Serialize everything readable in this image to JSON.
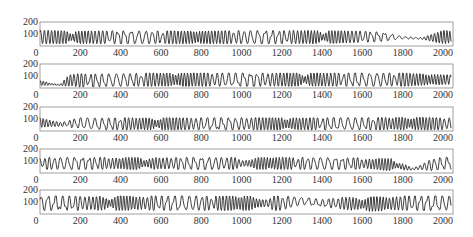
{
  "chart_data": [
    {
      "type": "line",
      "title": "",
      "xlabel": "",
      "ylabel": "",
      "xlim": [
        0,
        2050
      ],
      "ylim": [
        0,
        200
      ],
      "xticks": [
        0,
        200,
        400,
        600,
        800,
        1000,
        1200,
        1400,
        1600,
        1800,
        2000
      ],
      "yticks": [
        100,
        200
      ],
      "ytick_labels": [
        "200",
        "100"
      ],
      "x_origin_label": "0",
      "description": "Dense oscillation around 40-130; regular fast oscillation through ~1650, then slower waves, flat trough ~60 near 1800-1900, rising to ~130 near 2000",
      "envelope": {
        "x": [
          0,
          200,
          400,
          600,
          800,
          1000,
          1200,
          1400,
          1600,
          1700,
          1800,
          1900,
          2000
        ],
        "upper": [
          130,
          125,
          128,
          125,
          125,
          128,
          128,
          128,
          125,
          115,
          80,
          70,
          130
        ],
        "lower": [
          20,
          20,
          20,
          20,
          20,
          20,
          20,
          20,
          30,
          40,
          60,
          55,
          20
        ]
      }
    },
    {
      "type": "line",
      "title": "",
      "xlim": [
        0,
        2050
      ],
      "ylim": [
        0,
        200
      ],
      "xticks": [
        0,
        200,
        400,
        600,
        800,
        1000,
        1200,
        1400,
        1600,
        1800,
        2000
      ],
      "yticks": [
        100,
        200
      ],
      "description": "Low flat ~20-50 until ~120, large slow triangles ~150-350, then dense oscillation 20-125 through 2000 with a wide wave near 2000",
      "envelope": {
        "x": [
          0,
          100,
          150,
          300,
          400,
          600,
          800,
          1000,
          1200,
          1400,
          1600,
          1800,
          2000
        ],
        "upper": [
          60,
          30,
          120,
          115,
          120,
          125,
          125,
          125,
          125,
          125,
          125,
          125,
          110
        ],
        "lower": [
          20,
          20,
          10,
          10,
          15,
          15,
          15,
          15,
          15,
          15,
          15,
          15,
          30
        ]
      }
    },
    {
      "type": "line",
      "title": "",
      "xlim": [
        0,
        2050
      ],
      "ylim": [
        0,
        200
      ],
      "xticks": [
        0,
        200,
        400,
        600,
        800,
        1000,
        1200,
        1400,
        1600,
        1800,
        2000
      ],
      "yticks": [
        100,
        200
      ],
      "description": "Thick band 40-100 for 0-200, slow triangles 200-400, dense triangles to ~1800, larger triangles 1800-2000",
      "envelope": {
        "x": [
          0,
          100,
          200,
          300,
          400,
          600,
          800,
          1000,
          1200,
          1400,
          1600,
          1800,
          2000
        ],
        "upper": [
          110,
          70,
          110,
          105,
          110,
          110,
          110,
          110,
          110,
          110,
          110,
          115,
          110
        ],
        "lower": [
          30,
          40,
          20,
          10,
          10,
          10,
          10,
          10,
          10,
          10,
          10,
          10,
          10
        ]
      }
    },
    {
      "type": "line",
      "title": "",
      "xlim": [
        0,
        2050
      ],
      "ylim": [
        0,
        200
      ],
      "xticks": [
        0,
        200,
        400,
        600,
        800,
        1000,
        1200,
        1400,
        1600,
        1800,
        2000
      ],
      "yticks": [
        100,
        200
      ],
      "description": "Dense noisy oscillation 30-130 through ~1650, then wide peaks ~1750 and ~1950 with flat trough ~30 near 1800-1900",
      "envelope": {
        "x": [
          0,
          200,
          400,
          600,
          800,
          1000,
          1200,
          1400,
          1600,
          1750,
          1850,
          1950,
          2000
        ],
        "upper": [
          130,
          130,
          130,
          130,
          130,
          130,
          130,
          130,
          125,
          120,
          40,
          120,
          130
        ],
        "lower": [
          30,
          30,
          30,
          30,
          30,
          30,
          30,
          30,
          30,
          20,
          25,
          20,
          30
        ]
      }
    },
    {
      "type": "line",
      "title": "",
      "xlim": [
        0,
        2050
      ],
      "ylim": [
        0,
        200
      ],
      "xticks": [
        0,
        200,
        400,
        600,
        800,
        1000,
        1200,
        1400,
        1600,
        1800,
        2000
      ],
      "yticks": [
        100,
        200
      ],
      "description": "Dense noisy band 30-150 throughout; thick dark block ~1290-1400 around 80-130, slow waves near 1450 and 1600",
      "envelope": {
        "x": [
          0,
          200,
          400,
          600,
          800,
          1000,
          1200,
          1300,
          1400,
          1500,
          1600,
          1800,
          2000
        ],
        "upper": [
          150,
          150,
          150,
          150,
          150,
          150,
          150,
          140,
          120,
          140,
          140,
          150,
          150
        ],
        "lower": [
          30,
          30,
          30,
          30,
          30,
          30,
          30,
          80,
          60,
          40,
          20,
          30,
          30
        ]
      }
    }
  ],
  "axes": {
    "x_tick_labels": [
      "0",
      "200",
      "400",
      "600",
      "800",
      "1000",
      "1200",
      "1400",
      "1600",
      "1800",
      "2000"
    ],
    "y_tick_labels": [
      "200",
      "100"
    ],
    "line_color": "#2a2a2a",
    "frame_color": "#888888"
  }
}
